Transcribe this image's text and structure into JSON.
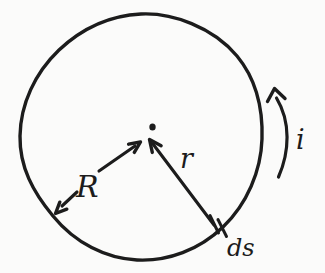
{
  "figure": {
    "labels": {
      "radius": "R",
      "position_vector": "r",
      "current_element": "ds",
      "current": "i"
    },
    "colors": {
      "ink": "#1c1c1c",
      "paper": "#fbfbfa"
    }
  }
}
